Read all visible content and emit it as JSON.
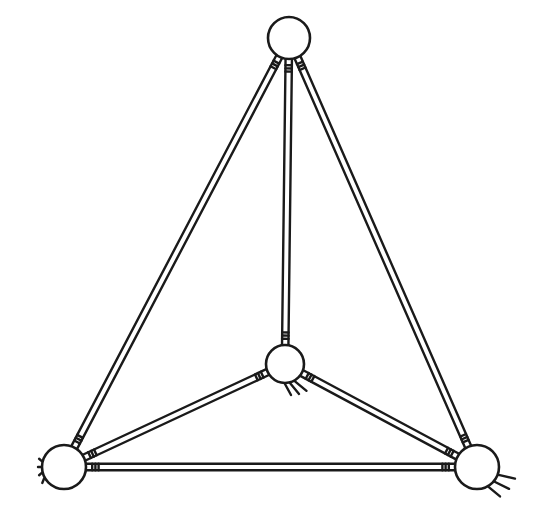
{
  "diagram": {
    "type": "ball-and-stick tetrahedron",
    "style": {
      "line_color": "#1a1a1a",
      "background": "#ffffff"
    },
    "nodes": [
      {
        "id": "top",
        "cx": 289,
        "cy": 38,
        "r": 21
      },
      {
        "id": "center",
        "cx": 285,
        "cy": 364,
        "r": 19
      },
      {
        "id": "bottom-left",
        "cx": 64,
        "cy": 467,
        "r": 22
      },
      {
        "id": "bottom-right",
        "cx": 477,
        "cy": 467,
        "r": 22
      }
    ],
    "edges": [
      {
        "from": "top",
        "to": "bottom-left"
      },
      {
        "from": "top",
        "to": "bottom-right"
      },
      {
        "from": "top",
        "to": "center"
      },
      {
        "from": "center",
        "to": "bottom-left"
      },
      {
        "from": "center",
        "to": "bottom-right"
      },
      {
        "from": "bottom-left",
        "to": "bottom-right"
      }
    ]
  }
}
